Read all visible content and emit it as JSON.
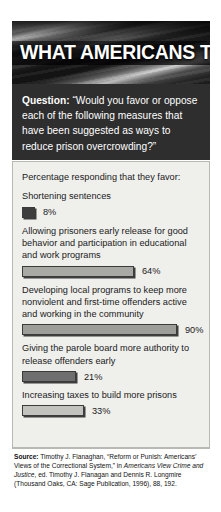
{
  "banner": {
    "title": "WHAT AMERICANS THINK",
    "image": "american-flag-grayscale"
  },
  "question": {
    "label": "Question:",
    "text": "“Would you favor or oppose each of the following measures that have been suggested as ways to reduce prison overcrowding?”"
  },
  "panel": {
    "lead": "Percentage responding that they favor:"
  },
  "source": {
    "label": "Source:",
    "line1": " Timothy J. Flanaghan, “Reform or Punish: Americans’ Views of the Correctional System,” in ",
    "italic": "Americans View Crime and Justice",
    "line2": ", ed. Timothy J. Flanagan and Dennis R. Longmire (Thousand Oaks, CA: Sage Publication, 1996), 88, 192."
  },
  "chart_data": {
    "type": "bar",
    "title": "WHAT AMERICANS THINK",
    "subtitle": "Percentage responding that they favor:",
    "xlabel": "",
    "ylabel": "Percent favoring",
    "xlim": [
      0,
      100
    ],
    "grid": false,
    "legend": "none",
    "orientation": "horizontal",
    "units": "percent",
    "categories": [
      "Shortening sentences",
      "Allowing prisoners early release for good behavior and participation in educational and work programs",
      "Developing local programs to keep more nonviolent and first-time offenders active and working in the community",
      "Giving the parole board more authority to release offenders early",
      "Increasing taxes to build more prisons"
    ],
    "values": [
      8,
      64,
      90,
      21,
      33
    ],
    "value_labels": [
      "8%",
      "64%",
      "90%",
      "21%",
      "33%"
    ],
    "bar_colors": [
      "#3d3d3d",
      "#a8a8a4",
      "#9d9d99",
      "#6e6e6e",
      "#c2c2be"
    ],
    "bar_pixel_widths": [
      13,
      112,
      155,
      54,
      62
    ]
  }
}
